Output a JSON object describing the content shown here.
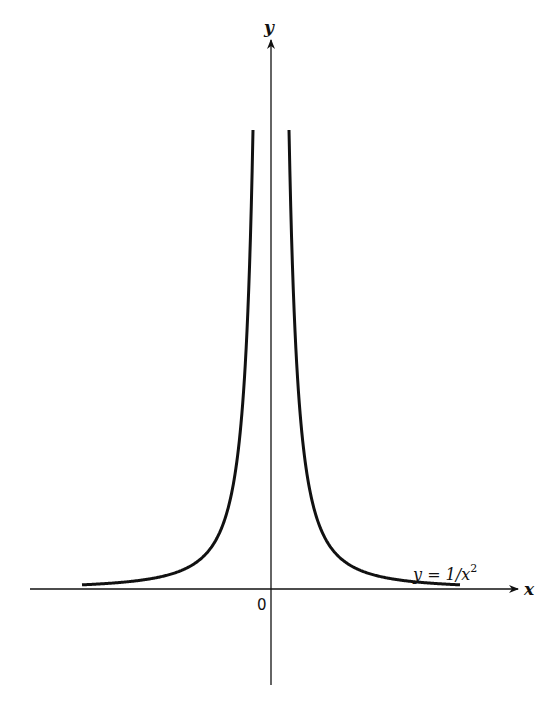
{
  "figure": {
    "axis_labels": {
      "x": "x",
      "y": "y",
      "origin": "0"
    },
    "curve_label": {
      "prefix": "y = 1/",
      "var": "x",
      "exponent": "2"
    },
    "colors": {
      "ink": "#111111",
      "background": "#ffffff"
    }
  },
  "chart_data": {
    "type": "line",
    "title": "",
    "function": "y = 1/x^2",
    "xlabel": "x",
    "ylabel": "y",
    "origin_label": "0",
    "grid": false,
    "legend": null,
    "annotations": [
      "y = 1/x^2"
    ],
    "branches": [
      {
        "name": "left branch (x < 0)",
        "x_range": [
          -10.5,
          -1
        ]
      },
      {
        "name": "right branch (x > 0)",
        "x_range": [
          1,
          10.5
        ]
      }
    ],
    "xlim": [
      -13.4,
      13.9
    ],
    "ylim": [
      -5.7,
      26.3
    ]
  }
}
